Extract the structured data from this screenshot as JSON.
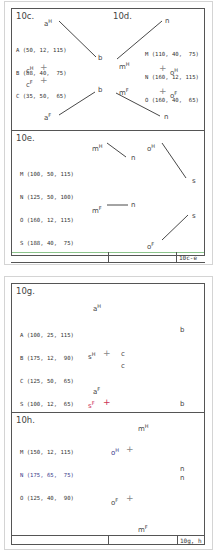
{
  "figures": [
    {
      "footer_label": "10c-e",
      "panels": [
        {
          "id": "10c",
          "title": "10c.",
          "coordinates": [
            "A (50, 12, 115)",
            "B (88, 40,  75)",
            "C (35, 50,  65)"
          ],
          "labels": {
            "aH": "a",
            "b1": "b",
            "b2": "b",
            "aF": "a",
            "cH": "c",
            "cF": "c"
          }
        },
        {
          "id": "10d",
          "title": "10d.",
          "coordinates": [
            "M (110, 40,  75)",
            "N (160, 12, 115)",
            "O (160, 40,  65)"
          ],
          "labels": {
            "n1": "n",
            "mH": "m",
            "mF": "m",
            "n2": "n",
            "oH": "o",
            "oF": "o"
          }
        },
        {
          "id": "10e",
          "title": "10e.",
          "coordinates": [
            "M (100, 50, 115)",
            "N (125, 50, 100)",
            "O (160, 12, 115)",
            "S (188, 40,  75)"
          ],
          "labels": {
            "mH": "m",
            "n1": "n",
            "oH": "o",
            "s1": "s",
            "mF": "m",
            "n2": "n",
            "s2": "s",
            "oF": "o"
          }
        }
      ]
    },
    {
      "footer_label": "10g, h",
      "panels": [
        {
          "id": "10g",
          "title": "10g.",
          "coordinates": [
            "A (100, 25, 115)",
            "B (175, 12,  90)",
            "C (125, 50,  65)",
            "S (100, 12,  65)"
          ],
          "labels": {
            "aH": "a",
            "b1": "b",
            "sH": "s",
            "c1": "c",
            "c2": "c",
            "aF": "a",
            "sF": "s",
            "b2": "b"
          }
        },
        {
          "id": "10h",
          "title": "10h.",
          "coordinates": [
            "M (150, 12, 115)",
            "N (175, 65,  75)",
            "O (125, 40,  90)"
          ],
          "labels": {
            "mH": "m",
            "oH": "o",
            "n1": "n",
            "n2": "n",
            "oF": "o",
            "mF": "m"
          }
        }
      ]
    }
  ],
  "superscripts": {
    "H": "H",
    "F": "F"
  },
  "colors": {
    "frame": "#555555",
    "card_border": "#d4d4d4",
    "line": "#333333",
    "accent_green": "#7bbf7b",
    "accent_red": "#cc3355",
    "accent_blue": "#3a3a8a"
  }
}
